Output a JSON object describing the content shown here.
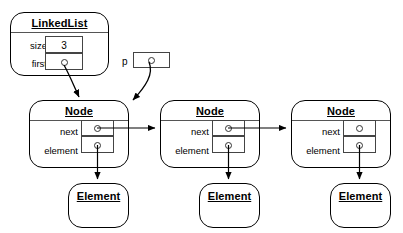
{
  "diagram": {
    "background_color": "#ffffff",
    "line_color": "#000000"
  },
  "linked_list": {
    "class_name": "LinkedList",
    "fields": [
      {
        "label": "size",
        "value": "3",
        "kind": "value"
      },
      {
        "label": "first",
        "value": "",
        "kind": "pointer"
      }
    ]
  },
  "pointer_variable": {
    "label": "p",
    "value": "",
    "kind": "pointer"
  },
  "nodes": [
    {
      "class_name": "Node",
      "fields": [
        {
          "label": "next",
          "value": "",
          "kind": "pointer"
        },
        {
          "label": "element",
          "value": "",
          "kind": "pointer"
        }
      ]
    },
    {
      "class_name": "Node",
      "fields": [
        {
          "label": "next",
          "value": "",
          "kind": "pointer"
        },
        {
          "label": "element",
          "value": "",
          "kind": "pointer"
        }
      ]
    },
    {
      "class_name": "Node",
      "fields": [
        {
          "label": "next",
          "value": "",
          "kind": "pointer"
        },
        {
          "label": "element",
          "value": "",
          "kind": "pointer"
        }
      ]
    }
  ],
  "elements": [
    {
      "class_name": "Element"
    },
    {
      "class_name": "Element"
    },
    {
      "class_name": "Element"
    }
  ]
}
